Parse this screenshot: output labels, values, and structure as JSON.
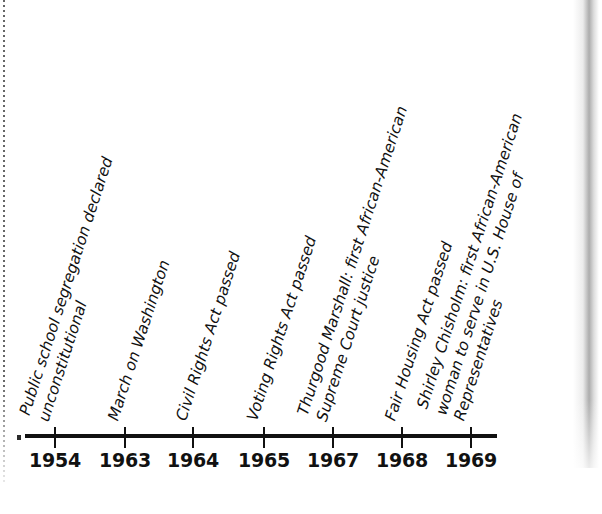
{
  "figure": {
    "kind": "timeline-chart",
    "background_color": "#ffffff",
    "ink_color": "#111111"
  },
  "chart_data": {
    "type": "timeline",
    "title": "",
    "subtitle": "",
    "xlabel": "",
    "ylabel": "",
    "orientation": "horizontal",
    "axis_range": [
      1954,
      1969
    ],
    "grid": false,
    "legend": null,
    "tick_labels": [
      "1954",
      "1963",
      "1964",
      "1965",
      "1967",
      "1968",
      "1969"
    ],
    "label_rotation_degrees": -72,
    "categories": [
      "1954",
      "1963",
      "1964",
      "1965",
      "1967",
      "1968",
      "1969"
    ],
    "values": [
      1954,
      1963,
      1964,
      1965,
      1967,
      1968,
      1969
    ],
    "events": [
      {
        "year": "1954",
        "x_px": 55,
        "lines": [
          "Public school segregation declared",
          "unconstitutional"
        ]
      },
      {
        "year": "1963",
        "x_px": 125,
        "lines": [
          "March on Washington"
        ]
      },
      {
        "year": "1964",
        "x_px": 193,
        "lines": [
          "Civil Rights Act passed"
        ]
      },
      {
        "year": "1965",
        "x_px": 264,
        "lines": [
          "Voting Rights Act passed"
        ]
      },
      {
        "year": "1967",
        "x_px": 333,
        "lines": [
          "Thurgood Marshall: first African-American",
          "Supreme Court justice"
        ]
      },
      {
        "year": "1968",
        "x_px": 402,
        "lines": [
          "Fair Housing Act passed"
        ]
      },
      {
        "year": "1969",
        "x_px": 471,
        "lines": [
          "Shirley Chisholm: first African-American",
          "woman to serve in U.S. House of",
          "Representatives"
        ]
      }
    ]
  }
}
